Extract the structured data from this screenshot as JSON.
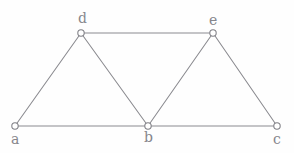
{
  "diagram": {
    "background_color": "#fefefe",
    "edge_color": "#8a8a8f",
    "vertex_fill_color": "#ffffff",
    "vertex_stroke_color": "#7e7e84",
    "label_color": "#86868c",
    "vertex_radius": 3.2,
    "width": 294,
    "height": 153,
    "vertices": [
      {
        "id": "a",
        "label": "a",
        "x": 15,
        "y": 126,
        "label_x": 11,
        "label_y": 132
      },
      {
        "id": "b",
        "label": "b",
        "x": 148,
        "y": 126,
        "label_x": 144,
        "label_y": 130
      },
      {
        "id": "c",
        "label": "c",
        "x": 277,
        "y": 126,
        "label_x": 273,
        "label_y": 132
      },
      {
        "id": "d",
        "label": "d",
        "x": 81,
        "y": 33,
        "label_x": 78,
        "label_y": 11
      },
      {
        "id": "e",
        "label": "e",
        "x": 213,
        "y": 33,
        "label_x": 209,
        "label_y": 13
      }
    ],
    "edges": [
      {
        "id": "edge-a-b",
        "from": "a",
        "to": "b"
      },
      {
        "id": "edge-b-c",
        "from": "b",
        "to": "c"
      },
      {
        "id": "edge-d-e",
        "from": "d",
        "to": "e"
      },
      {
        "id": "edge-a-d",
        "from": "a",
        "to": "d"
      },
      {
        "id": "edge-d-b",
        "from": "d",
        "to": "b"
      },
      {
        "id": "edge-b-e",
        "from": "b",
        "to": "e"
      },
      {
        "id": "edge-e-c",
        "from": "e",
        "to": "c"
      }
    ]
  }
}
